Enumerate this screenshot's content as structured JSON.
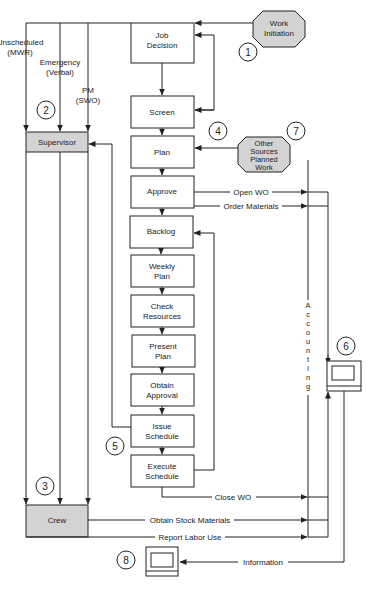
{
  "diagram": {
    "title": "",
    "process_boxes": [
      {
        "id": "job-decision",
        "lines": [
          "Job",
          "Decision"
        ]
      },
      {
        "id": "screen",
        "lines": [
          "Screen"
        ]
      },
      {
        "id": "plan",
        "lines": [
          "Plan"
        ]
      },
      {
        "id": "approve",
        "lines": [
          "Approve"
        ]
      },
      {
        "id": "backlog",
        "lines": [
          "Backlog"
        ]
      },
      {
        "id": "weekly-plan",
        "lines": [
          "Weekly",
          "Plan"
        ]
      },
      {
        "id": "check-resources",
        "lines": [
          "Check",
          "Resources"
        ]
      },
      {
        "id": "present-plan",
        "lines": [
          "Present",
          "Plan"
        ]
      },
      {
        "id": "obtain-approval",
        "lines": [
          "Obtain",
          "Approval"
        ]
      },
      {
        "id": "issue-schedule",
        "lines": [
          "Issue",
          "Schedule"
        ]
      },
      {
        "id": "execute-schedule",
        "lines": [
          "Execute",
          "Schedule"
        ]
      }
    ],
    "role_boxes": {
      "supervisor": "Supervisor",
      "crew": "Crew"
    },
    "sources": {
      "work_initiation": [
        "Work",
        "Initiation"
      ],
      "other_sources": [
        "Other",
        "Sources",
        "Planned",
        "Work"
      ]
    },
    "entry_paths": {
      "unscheduled": [
        "Unscheduled",
        "(MWR)"
      ],
      "emergency": [
        "Emergency",
        "(Verbal)"
      ],
      "pm": [
        "PM",
        "(SWO)"
      ]
    },
    "flow_labels": {
      "open_wo": "Open WO",
      "order_materials": "Order Materials",
      "close_wo": "Close WO",
      "obtain_stock": "Obtain Stock Materials",
      "report_labor": "Report Labor Use",
      "information": "Information"
    },
    "accounting_label": [
      "A",
      "c",
      "c",
      "o",
      "u",
      "n",
      "t",
      "i",
      "n",
      "g"
    ],
    "step_numbers": [
      "1",
      "2",
      "3",
      "4",
      "5",
      "6",
      "7",
      "8"
    ],
    "icons": {
      "computer_6": "computer-terminal-icon",
      "computer_8": "computer-terminal-icon"
    },
    "colors": {
      "line": "#222222",
      "role_fill": "#d3d3d3",
      "source_fill": "#d3d3d3",
      "box_fill": "#ffffff"
    }
  }
}
